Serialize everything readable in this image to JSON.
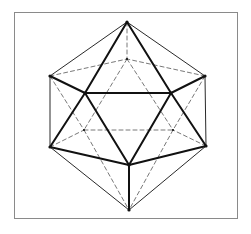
{
  "figure": {
    "frame": {
      "x": 14,
      "y": 12,
      "w": 223,
      "h": 206,
      "stroke": "#8a8a8a"
    },
    "colors": {
      "edge": "#111111",
      "hidden": "#555555"
    },
    "vertices": {
      "T": [
        127,
        22
      ],
      "BT": [
        127,
        59
      ],
      "L": [
        50,
        76
      ],
      "R": [
        205,
        76
      ],
      "FL": [
        85,
        93
      ],
      "FR": [
        171,
        93
      ],
      "BL": [
        84,
        130
      ],
      "BR": [
        173,
        130
      ],
      "LL": [
        50,
        147
      ],
      "RL": [
        206,
        146
      ],
      "FB": [
        129,
        165
      ],
      "B": [
        129,
        210
      ]
    },
    "edges_thin": [
      [
        "T",
        "L"
      ],
      [
        "T",
        "R"
      ],
      [
        "L",
        "LL"
      ],
      [
        "R",
        "RL"
      ],
      [
        "LL",
        "B"
      ],
      [
        "RL",
        "B"
      ]
    ],
    "edges_thick": [
      [
        "T",
        "FL"
      ],
      [
        "T",
        "FR"
      ],
      [
        "L",
        "FL"
      ],
      [
        "R",
        "FR"
      ],
      [
        "FL",
        "FR"
      ],
      [
        "FL",
        "FB"
      ],
      [
        "FR",
        "FB"
      ],
      [
        "FL",
        "LL"
      ],
      [
        "FR",
        "RL"
      ],
      [
        "LL",
        "FB"
      ],
      [
        "RL",
        "FB"
      ],
      [
        "FB",
        "B"
      ]
    ],
    "edges_hidden": [
      [
        "T",
        "BT"
      ],
      [
        "L",
        "BT"
      ],
      [
        "R",
        "BT"
      ],
      [
        "BT",
        "BL"
      ],
      [
        "BT",
        "BR"
      ],
      [
        "BL",
        "BR"
      ],
      [
        "L",
        "BL"
      ],
      [
        "R",
        "BR"
      ],
      [
        "LL",
        "BL"
      ],
      [
        "RL",
        "BR"
      ],
      [
        "BL",
        "B"
      ],
      [
        "BR",
        "B"
      ]
    ]
  }
}
